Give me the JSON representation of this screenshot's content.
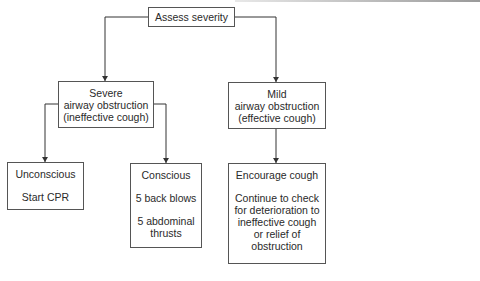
{
  "diagram": {
    "nodes": {
      "assess": {
        "lines": [
          "Assess severity"
        ]
      },
      "severe": {
        "lines": [
          "Severe",
          "airway obstruction",
          "(ineffective cough)"
        ]
      },
      "mild": {
        "lines": [
          "Mild",
          "airway obstruction",
          "(effective cough)"
        ]
      },
      "unconscious": {
        "heading": "Unconscious",
        "action": [
          "Start CPR"
        ]
      },
      "conscious": {
        "heading": "Conscious",
        "action1": [
          "5 back blows"
        ],
        "action2": [
          "5 abdominal",
          "thrusts"
        ]
      },
      "encourage": {
        "heading": "Encourage cough",
        "action": [
          "Continue to check",
          "for deterioration to",
          "ineffective cough",
          "or relief of",
          "obstruction"
        ]
      }
    },
    "edges": [
      {
        "from": "assess",
        "to": "severe"
      },
      {
        "from": "assess",
        "to": "mild"
      },
      {
        "from": "severe",
        "to": "unconscious"
      },
      {
        "from": "severe",
        "to": "conscious"
      },
      {
        "from": "mild",
        "to": "encourage"
      }
    ],
    "colors": {
      "line": "#333333",
      "border": "#555555",
      "text": "#2a2a2a",
      "background": "#ffffff"
    }
  }
}
